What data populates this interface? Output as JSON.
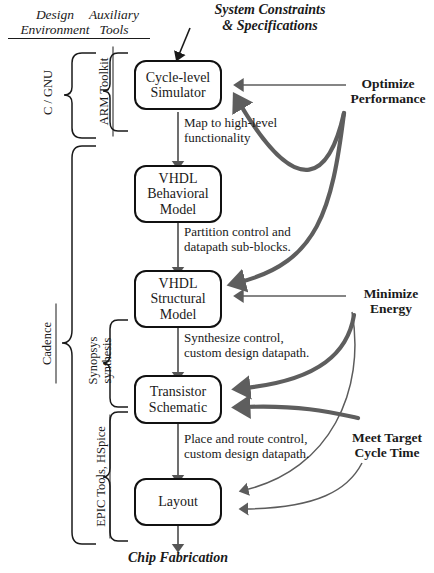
{
  "diagram": {
    "title": "System Constraints & Specifications",
    "top_label": "System Constraints\n& Specifications",
    "top_label_line1": "System Constraints",
    "top_label_line2": "& Specifications",
    "bottom_label": "Chip Fabrication",
    "colors": {
      "ink": "#1a1a1a",
      "box_border": "#111111",
      "thin_arrow": "#5a5a5a",
      "thick_arrow": "#575757",
      "flow_arrow": "#555555",
      "background": "#ffffff"
    }
  },
  "columns": [
    {
      "name": "design-environment",
      "line1": "Design",
      "line2": "Environment"
    },
    {
      "name": "auxiliary-tools",
      "line1": "Auxiliary",
      "line2": "Tools"
    }
  ],
  "brace_labels": [
    {
      "name": "c-gnu",
      "text": "C / GNU",
      "column": "design-environment"
    },
    {
      "name": "cadence",
      "text": "Cadence",
      "column": "design-environment"
    },
    {
      "name": "arm-toolkit",
      "text": "ARM Toolkit",
      "column": "auxiliary-tools"
    },
    {
      "name": "synopsys-synthesis",
      "line1": "Synopsys",
      "line2": "synthesis",
      "column": "auxiliary-tools"
    },
    {
      "name": "epic-tools-hspice",
      "text": "EPIC Tools, HSpice",
      "column": "auxiliary-tools"
    }
  ],
  "nodes": [
    {
      "name": "cycle-level-simulator",
      "line1": "Cycle-level",
      "line2": "Simulator"
    },
    {
      "name": "vhdl-behavioral-model",
      "line1": "VHDL",
      "line2": "Behavioral",
      "line3": "Model"
    },
    {
      "name": "vhdl-structural-model",
      "line1": "VHDL",
      "line2": "Structural",
      "line3": "Model"
    },
    {
      "name": "transistor-schematic",
      "line1": "Transistor",
      "line2": "Schematic"
    },
    {
      "name": "layout",
      "line1": "Layout"
    }
  ],
  "edges": [
    {
      "name": "edge-simulator-to-behavioral",
      "line1": "Map to high-level",
      "line2": "functionality"
    },
    {
      "name": "edge-behavioral-to-structural",
      "line1": "Partition control and",
      "line2": "datapath sub-blocks."
    },
    {
      "name": "edge-structural-to-transistor",
      "line1": "Synthesize control,",
      "line2": "custom design datapath."
    },
    {
      "name": "edge-transistor-to-layout",
      "line1": "Place and route control,",
      "line2": "custom design datapath."
    }
  ],
  "goals": [
    {
      "name": "optimize-performance",
      "line1": "Optimize",
      "line2": "Performance"
    },
    {
      "name": "minimize-energy",
      "line1": "Minimize",
      "line2": "Energy"
    },
    {
      "name": "meet-target-cycle-time",
      "line1": "Meet Target",
      "line2": "Cycle Time"
    }
  ]
}
